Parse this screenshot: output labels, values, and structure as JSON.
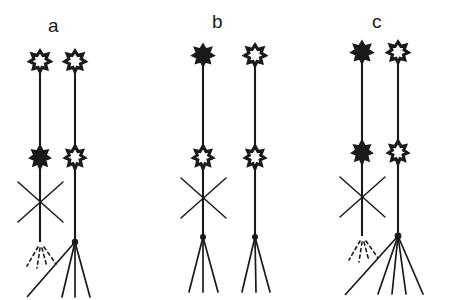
{
  "figure": {
    "title": "",
    "type": "scientific-line-drawing",
    "width": 459,
    "height": 300,
    "background_color": "#ffffff",
    "ink_color": "#1a1a1a"
  },
  "panels": [
    {
      "id": "a",
      "label": "a",
      "label_x": 48,
      "label_y": 16,
      "plants": [
        {
          "position": "left",
          "stem_x": 40,
          "top_flower": {
            "fill": "outline",
            "y": 61,
            "name": "top-flower"
          },
          "mid_flower": {
            "fill": "filled",
            "y": 157,
            "name": "mid-flower"
          },
          "cross_mark": true,
          "cross_y": 202,
          "roots": "dashed",
          "root_count": 3,
          "connector_to_partner": true
        },
        {
          "position": "right",
          "stem_x": 75,
          "top_flower": {
            "fill": "outline",
            "y": 61,
            "name": "top-flower"
          },
          "mid_flower": {
            "fill": "outline",
            "y": 157,
            "name": "mid-flower"
          },
          "cross_mark": false,
          "roots": "solid",
          "root_count": 3,
          "connector_to_partner": false
        }
      ]
    },
    {
      "id": "b",
      "label": "b",
      "label_x": 212,
      "label_y": 12,
      "plants": [
        {
          "position": "left",
          "stem_x": 203,
          "top_flower": {
            "fill": "filled",
            "y": 55,
            "name": "top-flower"
          },
          "mid_flower": {
            "fill": "outline",
            "y": 157,
            "name": "mid-flower"
          },
          "cross_mark": true,
          "cross_y": 198,
          "roots": "solid",
          "root_count": 3,
          "connector_to_partner": false
        },
        {
          "position": "right",
          "stem_x": 255,
          "top_flower": {
            "fill": "outline",
            "y": 55,
            "name": "top-flower"
          },
          "mid_flower": {
            "fill": "outline",
            "y": 157,
            "name": "mid-flower"
          },
          "cross_mark": false,
          "roots": "solid",
          "root_count": 3,
          "connector_to_partner": false
        }
      ]
    },
    {
      "id": "c",
      "label": "c",
      "label_x": 372,
      "label_y": 12,
      "plants": [
        {
          "position": "left",
          "stem_x": 362,
          "top_flower": {
            "fill": "filled",
            "y": 52,
            "name": "top-flower"
          },
          "mid_flower": {
            "fill": "filled",
            "y": 152,
            "name": "mid-flower"
          },
          "cross_mark": true,
          "cross_y": 197,
          "roots": "dashed",
          "root_count": 3,
          "connector_to_partner": true
        },
        {
          "position": "right",
          "stem_x": 398,
          "top_flower": {
            "fill": "outline",
            "y": 52,
            "name": "top-flower"
          },
          "mid_flower": {
            "fill": "outline",
            "y": 152,
            "name": "mid-flower"
          },
          "cross_mark": false,
          "roots": "solid",
          "root_count": 4,
          "connector_to_partner": false
        }
      ]
    }
  ],
  "legend_semantics": {
    "filled_flower": "solid black star glyph",
    "outline_flower": "white star glyph with black outline",
    "cross_mark": "X over stem",
    "dashed_roots": "severed / removed root system",
    "solid_roots": "intact root system"
  }
}
